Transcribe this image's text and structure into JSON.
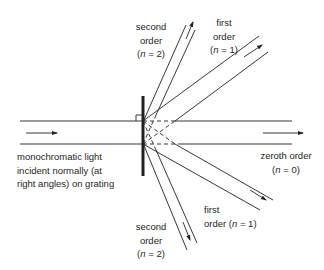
{
  "diagram": {
    "colors": {
      "line": "#231f20",
      "background": "#ffffff"
    },
    "incident_label": [
      "monochromatic light",
      "incident normally (at",
      "right angles) on grating"
    ],
    "orders": {
      "second_top": {
        "lines": [
          "second",
          "order",
          "(n = 2)"
        ],
        "n": "n",
        "eq": " = 2"
      },
      "first_top": {
        "lines": [
          "first",
          "order",
          "(n = 1)"
        ],
        "n": "n",
        "eq": " = 1"
      },
      "zeroth": {
        "line1": "zeroth order",
        "n": "n",
        "eq": " = 0"
      },
      "first_bottom": {
        "line1": "first",
        "line2_prefix": "order (",
        "n": "n",
        "eq": " = 1)"
      },
      "second_bottom": {
        "lines": [
          "second",
          "order",
          "(n = 2)"
        ],
        "n": "n",
        "eq": " = 2"
      }
    },
    "labels": {
      "second_top_1": "second",
      "second_top_2": "order",
      "first_top_1": "first",
      "first_top_2": "order",
      "zeroth_1": "zeroth order",
      "first_bot_1": "first",
      "first_bot_2": "order (",
      "second_bot_1": "second",
      "second_bot_2": "order",
      "incident_1": "monochromatic light",
      "incident_2": "incident normally (at",
      "incident_3": "right angles) on grating",
      "n_symbol": "n",
      "eq2": " = 2",
      "eq1": " = 1",
      "eq0": " = 0",
      "open_paren": "(",
      "close_paren": ")",
      "eq1_close": " = 1)"
    }
  }
}
